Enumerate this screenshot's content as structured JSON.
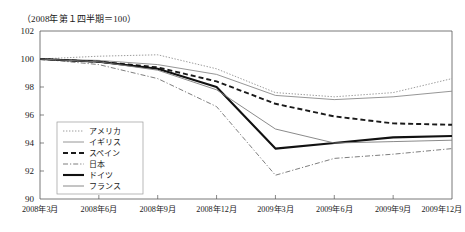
{
  "chart_data": {
    "type": "line",
    "title": "",
    "note": "（2008年第１四半期＝100）",
    "xlabel": "",
    "ylabel": "",
    "categories": [
      "2008年3月",
      "2008年6月",
      "2008年9月",
      "2008年12月",
      "2009年3月",
      "2009年6月",
      "2009年9月",
      "2009年12月"
    ],
    "ylim": [
      90,
      102
    ],
    "yticks": [
      90,
      92,
      94,
      96,
      98,
      100,
      102
    ],
    "ytick_labels": [
      "90",
      "92",
      "94",
      "96",
      "98",
      "100",
      "102"
    ],
    "grid": false,
    "legend_position": "lower-left",
    "series": [
      {
        "name": "アメリカ",
        "style": "dotted",
        "color": "#9c9c9c",
        "width": 1.0,
        "values": [
          100.0,
          100.2,
          100.3,
          99.3,
          97.6,
          97.3,
          97.6,
          98.6
        ]
      },
      {
        "name": "イギリス",
        "style": "solid-thin",
        "color": "#8a8a8a",
        "width": 0.9,
        "values": [
          100.0,
          99.9,
          99.6,
          98.9,
          97.4,
          97.1,
          97.3,
          97.7
        ]
      },
      {
        "name": "スペイン",
        "style": "dashed",
        "color": "#1a1a1a",
        "width": 1.9,
        "values": [
          100.0,
          99.8,
          99.4,
          98.4,
          96.8,
          95.9,
          95.4,
          95.3
        ]
      },
      {
        "name": "日本",
        "style": "dash-dot",
        "color": "#6f6f6f",
        "width": 0.9,
        "values": [
          100.0,
          99.6,
          98.6,
          96.6,
          91.7,
          92.9,
          93.2,
          93.6
        ]
      },
      {
        "name": "ドイツ",
        "style": "solid-thick",
        "color": "#111111",
        "width": 2.1,
        "values": [
          100.0,
          99.8,
          99.3,
          98.0,
          93.6,
          94.0,
          94.4,
          94.5
        ]
      },
      {
        "name": "フランス",
        "style": "solid-thin2",
        "color": "#7d7d7d",
        "width": 0.9,
        "values": [
          100.0,
          99.8,
          99.2,
          97.8,
          95.0,
          94.0,
          94.1,
          94.2
        ]
      }
    ]
  }
}
